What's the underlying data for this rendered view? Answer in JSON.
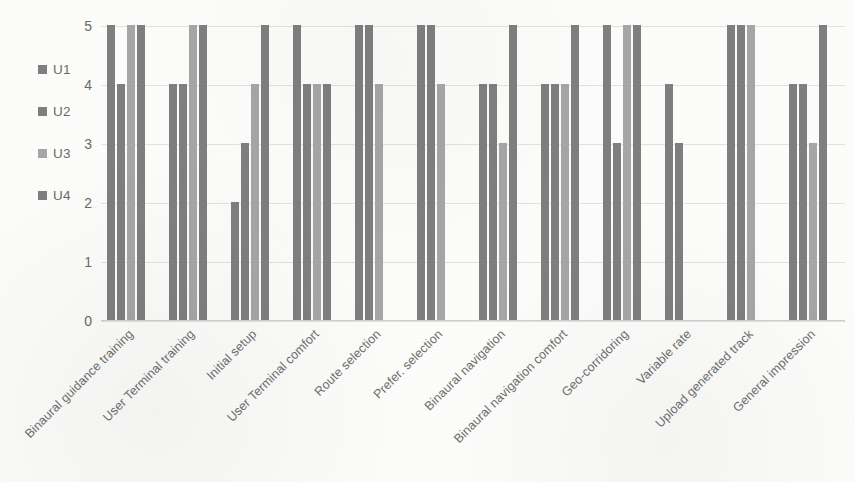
{
  "legend": {
    "position": "left",
    "items": [
      {
        "label": "U1",
        "color": "#7f7f7f"
      },
      {
        "label": "U2",
        "color": "#7f7f7f"
      },
      {
        "label": "U3",
        "color": "#a6a6a6"
      },
      {
        "label": "U4",
        "color": "#7f7f7f"
      }
    ]
  },
  "axis": {
    "y_ticks": [
      "0",
      "1",
      "2",
      "3",
      "4",
      "5"
    ]
  },
  "chart_data": {
    "type": "bar",
    "title": "",
    "subtitle": "",
    "xlabel": "",
    "ylabel": "",
    "ylim": [
      0,
      5
    ],
    "ytick_values": [
      0,
      1,
      2,
      3,
      4,
      5
    ],
    "grid": true,
    "legend_position": "left",
    "categories": [
      "Binaural guidance training",
      "User Terminal training",
      "Initial setup",
      "User Terminal comfort",
      "Route selection",
      "Prefer. selection",
      "Binaural navigation",
      "Binaural navigation comfort",
      "Geo-corridoring",
      "Variable rate",
      "Upload generated track",
      "General impression"
    ],
    "series": [
      {
        "name": "U1",
        "color": "#7f7f7f",
        "values": [
          5,
          4,
          2,
          5,
          5,
          5,
          4,
          4,
          5,
          4,
          5,
          4
        ]
      },
      {
        "name": "U2",
        "color": "#7f7f7f",
        "values": [
          4,
          4,
          3,
          4,
          5,
          5,
          4,
          4,
          3,
          3,
          5,
          4
        ]
      },
      {
        "name": "U3",
        "color": "#a6a6a6",
        "values": [
          5,
          5,
          4,
          4,
          4,
          4,
          3,
          4,
          5,
          null,
          5,
          3
        ]
      },
      {
        "name": "U4",
        "color": "#7f7f7f",
        "values": [
          5,
          5,
          5,
          4,
          null,
          null,
          5,
          5,
          5,
          null,
          null,
          5
        ]
      }
    ]
  }
}
